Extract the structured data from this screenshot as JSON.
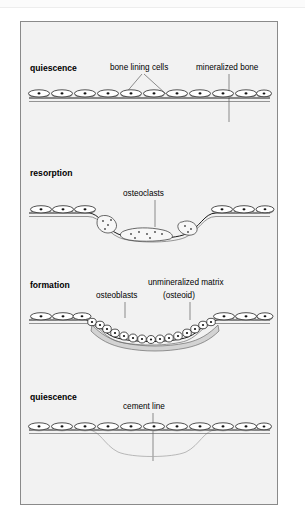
{
  "figure": {
    "background_color": "#f2f2f2",
    "border_color": "#8a8a8a"
  },
  "panels": [
    {
      "id": "panel-quiescence-1",
      "stage_label": "quiescence",
      "labels": [
        {
          "name": "bone-lining-cells",
          "text": "bone lining cells"
        },
        {
          "name": "mineralized-bone",
          "text": "mineralized bone"
        }
      ]
    },
    {
      "id": "panel-resorption",
      "stage_label": "resorption",
      "labels": [
        {
          "name": "osteoclasts",
          "text": "osteoclasts"
        }
      ]
    },
    {
      "id": "panel-formation",
      "stage_label": "formation",
      "labels": [
        {
          "name": "osteoblasts",
          "text": "osteoblasts"
        },
        {
          "name": "unmineralized-matrix",
          "text": "unmineralized matrix"
        },
        {
          "name": "osteoid",
          "text": "(osteoid)"
        }
      ]
    },
    {
      "id": "panel-quiescence-2",
      "stage_label": "quiescence",
      "labels": [
        {
          "name": "cement-line",
          "text": "cement line"
        }
      ]
    }
  ],
  "colors": {
    "cell_fill": "#ffffff",
    "cell_outline": "#1a1a1a",
    "nucleus": "#111111",
    "osteoid": "#d3d3d3",
    "cement_line": "#a8a8a8",
    "leader_line": "#5e5e5e"
  }
}
